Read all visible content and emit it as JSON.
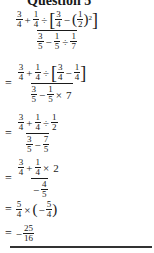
{
  "title": "Question 5",
  "steps": [
    {
      "prefix": "",
      "numerator": "3/4 + 1/4 ÷ [3/4 − (1/2)^2]",
      "denominator": "3/5 − 1/5 ÷ 1/7"
    },
    {
      "prefix": "=",
      "numerator": "3/4 + 1/4 ÷ [3/4 − 1/4]",
      "denominator": "3/5 − 1/5 × 7"
    },
    {
      "prefix": "=",
      "numerator": "3/4 + 1/4 ÷ 1/2",
      "denominator": "3/5 − 7/5"
    },
    {
      "prefix": "=",
      "numerator": "3/4 + 1/4 × 2",
      "denominator": "−4/5"
    },
    {
      "prefix": "=",
      "expression": "5/4 × (−5/4)"
    },
    {
      "prefix": "=",
      "expression": "−25/16"
    }
  ],
  "sym": {
    "eq": "=",
    "plus": "+",
    "minus": "−",
    "div": "÷",
    "times": "×",
    "lb": "[",
    "rb": "]",
    "lp": "(",
    "rp": ")",
    "sq": "2",
    "n1": "1",
    "n2": "2",
    "n3": "3",
    "n4": "4",
    "n5": "5",
    "n7": "7",
    "n16": "16",
    "n25": "25"
  }
}
